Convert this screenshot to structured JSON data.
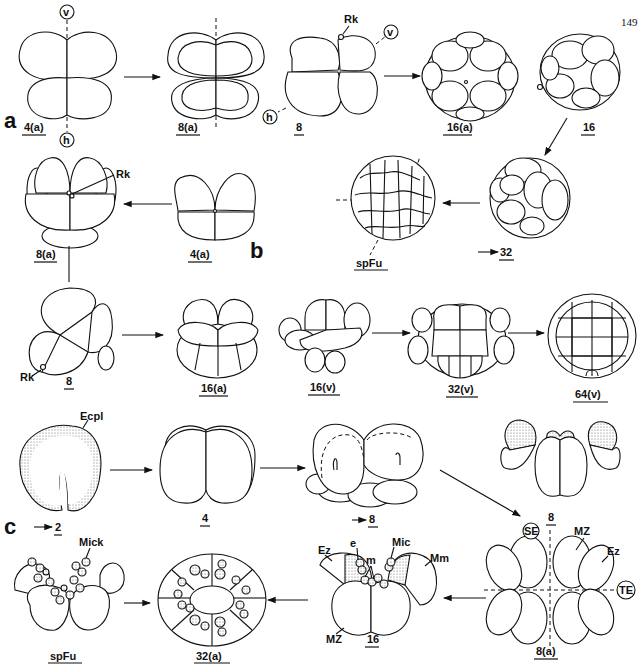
{
  "page_number": "149",
  "panels": {
    "a": {
      "label": "a",
      "stages": [
        {
          "id": "a-4a",
          "label": "4(a)",
          "axes": [
            "v",
            "h"
          ]
        },
        {
          "id": "a-8a",
          "label": "8(a)"
        },
        {
          "id": "a-8",
          "label": "8",
          "annotations": [
            "Rk",
            "v",
            "h"
          ]
        },
        {
          "id": "a-16a",
          "label": "16(a)"
        },
        {
          "id": "a-16",
          "label": "16"
        },
        {
          "id": "a-32",
          "label": "32",
          "arrow_prefix": true
        },
        {
          "id": "a-spFu",
          "label": "spFu"
        }
      ]
    },
    "b": {
      "label": "b",
      "stages": [
        {
          "id": "b-4a",
          "label": "4(a)"
        },
        {
          "id": "b-8a",
          "label": "8(a)",
          "annotations": [
            "Rk"
          ]
        },
        {
          "id": "b-8",
          "label": "8",
          "annotations": [
            "Rk"
          ]
        },
        {
          "id": "b-16a",
          "label": "16(a)"
        },
        {
          "id": "b-16v",
          "label": "16(v)"
        },
        {
          "id": "b-32v",
          "label": "32(v)"
        },
        {
          "id": "b-64v",
          "label": "64(v)"
        }
      ]
    },
    "c": {
      "label": "c",
      "stages": [
        {
          "id": "c-2",
          "label": "2",
          "arrow_prefix": true,
          "annotations": [
            "Ecpl"
          ]
        },
        {
          "id": "c-4",
          "label": "4"
        },
        {
          "id": "c-8-side",
          "label": "8",
          "arrow_prefix": true
        },
        {
          "id": "c-8",
          "label": "8"
        },
        {
          "id": "c-8a",
          "label": "8(a)",
          "annotations": [
            "SE",
            "MZ",
            "Ez",
            "TE"
          ]
        },
        {
          "id": "c-16",
          "label": "16",
          "annotations": [
            "e",
            "m",
            "Mic",
            "Mm",
            "Ez",
            "MZ"
          ]
        },
        {
          "id": "c-32a",
          "label": "32(a)"
        },
        {
          "id": "c-spFu",
          "label": "spFu",
          "annotations": [
            "Mick"
          ]
        }
      ]
    }
  },
  "labels": {
    "v": "v",
    "h": "h",
    "Rk": "Rk",
    "Ecpl": "Ecpl",
    "SE": "SE",
    "TE": "TE",
    "MZ": "MZ",
    "Ez": "Ez",
    "e": "e",
    "m": "m",
    "Mic": "Mic",
    "Mm": "Mm",
    "Mick": "Mick"
  }
}
